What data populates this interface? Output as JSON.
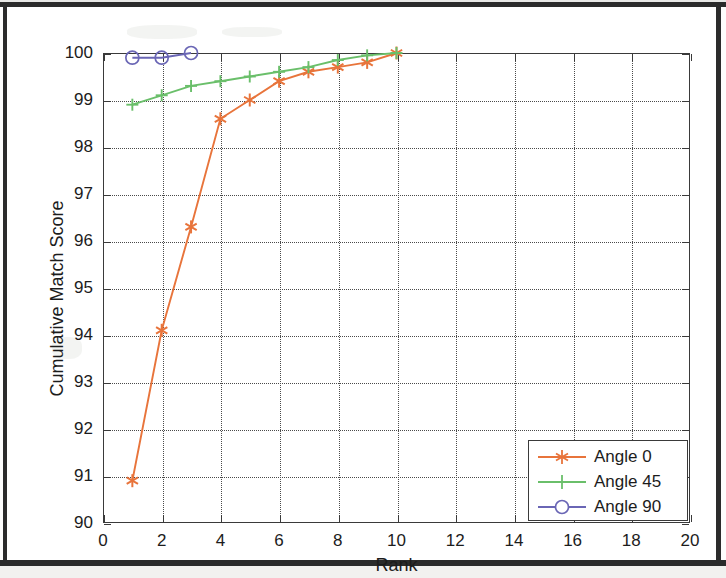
{
  "chart_data": {
    "type": "line",
    "title": "",
    "xlabel": "Rank",
    "ylabel": "Cumulative Match Score",
    "xlim": [
      0,
      20
    ],
    "ylim": [
      90,
      100
    ],
    "xticks": [
      0,
      2,
      4,
      6,
      8,
      10,
      12,
      14,
      16,
      18,
      20
    ],
    "yticks": [
      90,
      91,
      92,
      93,
      94,
      95,
      96,
      97,
      98,
      99,
      100
    ],
    "grid": true,
    "legend_position": "lower right",
    "series": [
      {
        "name": "Angle 0",
        "color": "#e8743b",
        "marker": "asterisk",
        "x": [
          1,
          2,
          3,
          4,
          5,
          6,
          7,
          8,
          9,
          10
        ],
        "values": [
          90.9,
          94.1,
          96.3,
          98.6,
          99.0,
          99.4,
          99.6,
          99.7,
          99.8,
          100.0
        ]
      },
      {
        "name": "Angle 45",
        "color": "#6abf6a",
        "marker": "plus",
        "x": [
          1,
          2,
          3,
          4,
          5,
          6,
          7,
          8,
          9,
          10
        ],
        "values": [
          98.9,
          99.1,
          99.3,
          99.4,
          99.5,
          99.6,
          99.7,
          99.85,
          99.95,
          100.0
        ]
      },
      {
        "name": "Angle 90",
        "color": "#6a66b5",
        "marker": "circle",
        "x": [
          1,
          2,
          3
        ],
        "values": [
          99.9,
          99.9,
          100.0
        ]
      }
    ]
  },
  "axes": {
    "xtick_labels": [
      "0",
      "2",
      "4",
      "6",
      "8",
      "10",
      "12",
      "14",
      "16",
      "18",
      "20"
    ],
    "ytick_labels": [
      "90",
      "91",
      "92",
      "93",
      "94",
      "95",
      "96",
      "97",
      "98",
      "99",
      "100"
    ],
    "x_axis_label": "Rank",
    "y_axis_label": "Cumulative Match Score"
  },
  "legend": {
    "entries": [
      {
        "label": "Angle 0",
        "color": "#e8743b",
        "marker": "asterisk-icon"
      },
      {
        "label": "Angle 45",
        "color": "#6abf6a",
        "marker": "plus-icon"
      },
      {
        "label": "Angle 90",
        "color": "#6a66b5",
        "marker": "circle-icon"
      }
    ]
  },
  "colors": {
    "angle_0": "#e8743b",
    "angle_45": "#6abf6a",
    "angle_90": "#6a66b5",
    "axis": "#3a3a3a",
    "frame": "#2b2b2b",
    "background": "#ffffff"
  }
}
